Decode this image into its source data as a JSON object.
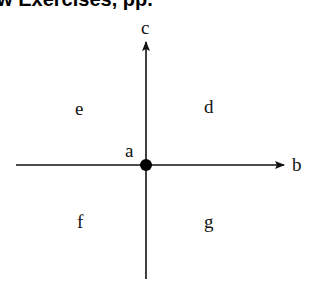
{
  "header": {
    "title_fragment": "ew Exercises, pp. "
  },
  "diagram": {
    "point_label": "a",
    "horizontal_axis_label": "b",
    "vertical_axis_label": "c",
    "quadrants": {
      "upper_right": "d",
      "upper_left": "e",
      "lower_left": "f",
      "lower_right": "g"
    },
    "colors": {
      "line": "#111111",
      "dot": "#000000"
    }
  }
}
